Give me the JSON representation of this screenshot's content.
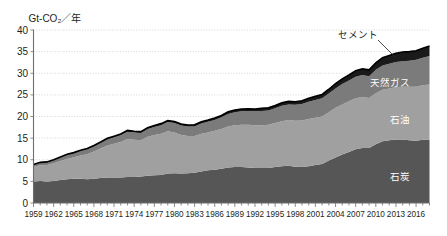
{
  "chart_data": {
    "type": "area",
    "stacked": true,
    "title": "",
    "ylabel": "Gt-CO₂／年",
    "xlabel": "",
    "ylim": [
      0,
      40
    ],
    "ytick_values": [
      0,
      5,
      10,
      15,
      20,
      25,
      30,
      35,
      40
    ],
    "ytick_labels": [
      "0",
      "5",
      "10",
      "15",
      "20",
      "25",
      "30",
      "35",
      "40"
    ],
    "xlim": [
      1959,
      2018
    ],
    "xtick_labels": [
      "1959",
      "1962",
      "1965",
      "1968",
      "1971",
      "1974",
      "1977",
      "1980",
      "1983",
      "1986",
      "1989",
      "1992",
      "1995",
      "1998",
      "2001",
      "2004",
      "2007",
      "2010",
      "2013",
      "2016"
    ],
    "xtick_values": [
      1959,
      1962,
      1965,
      1968,
      1971,
      1974,
      1977,
      1980,
      1983,
      1986,
      1989,
      1992,
      1995,
      1998,
      2001,
      2004,
      2007,
      2010,
      2013,
      2016
    ],
    "grid": true,
    "legend_position": "inline-labels",
    "x": [
      1959,
      1960,
      1961,
      1962,
      1963,
      1964,
      1965,
      1966,
      1967,
      1968,
      1969,
      1970,
      1971,
      1972,
      1973,
      1974,
      1975,
      1976,
      1977,
      1978,
      1979,
      1980,
      1981,
      1982,
      1983,
      1984,
      1985,
      1986,
      1987,
      1988,
      1989,
      1990,
      1991,
      1992,
      1993,
      1994,
      1995,
      1996,
      1997,
      1998,
      1999,
      2000,
      2001,
      2002,
      2003,
      2004,
      2005,
      2006,
      2007,
      2008,
      2009,
      2010,
      2011,
      2012,
      2013,
      2014,
      2015,
      2016,
      2017,
      2018
    ],
    "series": [
      {
        "name": "石炭",
        "color": "#565656",
        "label_color": "#ffffff",
        "values": [
          5.0,
          5.1,
          5.0,
          5.1,
          5.3,
          5.5,
          5.6,
          5.6,
          5.5,
          5.6,
          5.8,
          5.9,
          5.9,
          5.9,
          6.0,
          6.0,
          6.1,
          6.3,
          6.4,
          6.5,
          6.8,
          6.9,
          6.8,
          6.9,
          7.0,
          7.3,
          7.6,
          7.7,
          7.9,
          8.2,
          8.3,
          8.3,
          8.2,
          8.1,
          8.1,
          8.1,
          8.3,
          8.5,
          8.6,
          8.4,
          8.3,
          8.5,
          8.8,
          9.0,
          9.8,
          10.5,
          11.2,
          11.8,
          12.4,
          12.7,
          12.7,
          13.6,
          14.3,
          14.5,
          14.7,
          14.7,
          14.5,
          14.4,
          14.6,
          14.7
        ]
      },
      {
        "name": "石油",
        "color": "#a0a0a0",
        "label_color": "#ffffff",
        "values": [
          3.3,
          3.6,
          3.8,
          4.1,
          4.4,
          4.7,
          5.0,
          5.4,
          5.8,
          6.3,
          6.8,
          7.4,
          7.8,
          8.2,
          8.8,
          8.6,
          8.4,
          9.0,
          9.3,
          9.5,
          9.8,
          9.4,
          8.9,
          8.6,
          8.5,
          8.7,
          8.7,
          9.0,
          9.2,
          9.5,
          9.7,
          9.8,
          9.9,
          9.9,
          9.9,
          10.0,
          10.2,
          10.4,
          10.6,
          10.6,
          10.8,
          10.9,
          10.9,
          11.0,
          11.2,
          11.5,
          11.6,
          11.7,
          11.8,
          11.8,
          11.6,
          11.8,
          11.9,
          12.0,
          12.1,
          12.2,
          12.4,
          12.5,
          12.6,
          12.7
        ]
      },
      {
        "name": "天然ガス",
        "color": "#7b7b7b",
        "label_color": "#ffffff",
        "values": [
          0.5,
          0.6,
          0.6,
          0.7,
          0.8,
          0.9,
          0.9,
          1.0,
          1.1,
          1.2,
          1.3,
          1.4,
          1.5,
          1.6,
          1.7,
          1.7,
          1.7,
          1.8,
          1.9,
          2.0,
          2.1,
          2.2,
          2.2,
          2.2,
          2.2,
          2.4,
          2.5,
          2.5,
          2.7,
          2.9,
          3.0,
          3.1,
          3.2,
          3.2,
          3.3,
          3.3,
          3.4,
          3.6,
          3.6,
          3.7,
          3.8,
          4.0,
          4.1,
          4.2,
          4.3,
          4.5,
          4.7,
          4.8,
          5.0,
          5.1,
          5.0,
          5.4,
          5.6,
          5.7,
          5.8,
          5.9,
          6.0,
          6.2,
          6.4,
          6.6
        ]
      },
      {
        "name": "セメント",
        "color": "#1a1a1a",
        "label_color": "#231f20",
        "values": [
          0.1,
          0.1,
          0.1,
          0.1,
          0.15,
          0.15,
          0.15,
          0.2,
          0.2,
          0.2,
          0.2,
          0.25,
          0.25,
          0.25,
          0.3,
          0.3,
          0.3,
          0.3,
          0.3,
          0.35,
          0.35,
          0.35,
          0.35,
          0.35,
          0.4,
          0.4,
          0.4,
          0.45,
          0.45,
          0.5,
          0.5,
          0.5,
          0.5,
          0.55,
          0.6,
          0.6,
          0.65,
          0.65,
          0.7,
          0.7,
          0.75,
          0.8,
          0.85,
          0.9,
          1.0,
          1.1,
          1.2,
          1.3,
          1.4,
          1.4,
          1.5,
          1.6,
          1.8,
          1.9,
          2.0,
          2.1,
          2.1,
          2.1,
          2.2,
          2.3
        ]
      }
    ],
    "inline_labels": [
      {
        "name": "セメント",
        "x": 358,
        "y": 38,
        "anchor": "callout"
      },
      {
        "name": "天然ガス",
        "x": 390,
        "y": 86,
        "anchor": "inside"
      },
      {
        "name": "石油",
        "x": 400,
        "y": 123,
        "anchor": "inside"
      },
      {
        "name": "石炭",
        "x": 400,
        "y": 180,
        "anchor": "inside"
      }
    ],
    "callout_leader": {
      "from_x": 378,
      "from_y": 40,
      "to_x": 396,
      "to_y": 58
    }
  }
}
